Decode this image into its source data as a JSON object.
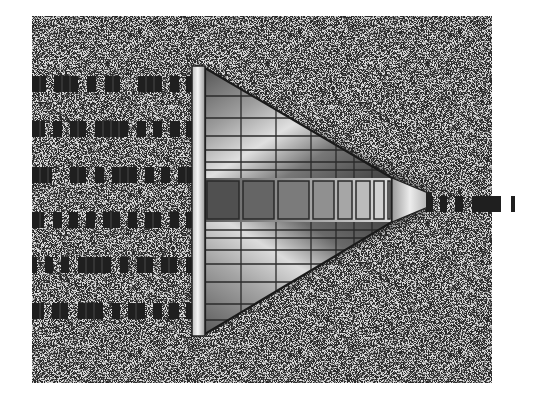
{
  "figure": {
    "background_color": "#ffffff",
    "noise_field": {
      "x": 32,
      "y": 16,
      "width": 460,
      "height": 367,
      "base": "#d8d8d8"
    },
    "prism": {
      "left_bar": {
        "x": 192,
        "y": 66,
        "width": 13,
        "height": 270
      },
      "apex": {
        "x": 392,
        "y": 200
      },
      "nozzle": {
        "x1": 392,
        "y1": 178,
        "x2": 428,
        "y2": 193,
        "y3": 207,
        "y4": 222
      },
      "center_band": {
        "y": 178,
        "height": 44
      },
      "center_cells_x": [
        205,
        241,
        276,
        311,
        336,
        354,
        372,
        386,
        392
      ],
      "colors": {
        "dark": "#3a3a3a",
        "mid": "#8a8a8a",
        "light": "#e6e6e6",
        "outline": "#202020"
      }
    },
    "input_streams": [
      {
        "y": 76,
        "dashes": [
          [
            32,
            46
          ],
          [
            54,
            78
          ],
          [
            87,
            96
          ],
          [
            105,
            120
          ],
          [
            138,
            162
          ],
          [
            170,
            179
          ],
          [
            186,
            192
          ]
        ]
      },
      {
        "y": 121,
        "dashes": [
          [
            32,
            45
          ],
          [
            53,
            62
          ],
          [
            70,
            86
          ],
          [
            95,
            128
          ],
          [
            137,
            146
          ],
          [
            153,
            162
          ],
          [
            170,
            180
          ],
          [
            186,
            192
          ]
        ]
      },
      {
        "y": 167,
        "dashes": [
          [
            32,
            52
          ],
          [
            70,
            86
          ],
          [
            95,
            104
          ],
          [
            112,
            137
          ],
          [
            145,
            154
          ],
          [
            161,
            170
          ],
          [
            178,
            192
          ]
        ]
      },
      {
        "y": 212,
        "dashes": [
          [
            32,
            44
          ],
          [
            53,
            62
          ],
          [
            69,
            78
          ],
          [
            86,
            95
          ],
          [
            103,
            120
          ],
          [
            128,
            137
          ],
          [
            145,
            161
          ],
          [
            170,
            179
          ],
          [
            186,
            192
          ]
        ]
      },
      {
        "y": 257,
        "dashes": [
          [
            32,
            37
          ],
          [
            45,
            53
          ],
          [
            61,
            69
          ],
          [
            78,
            111
          ],
          [
            120,
            128
          ],
          [
            137,
            153
          ],
          [
            161,
            177
          ],
          [
            186,
            192
          ]
        ]
      },
      {
        "y": 303,
        "dashes": [
          [
            32,
            44
          ],
          [
            52,
            68
          ],
          [
            78,
            103
          ],
          [
            112,
            120
          ],
          [
            128,
            145
          ],
          [
            153,
            162
          ],
          [
            169,
            179
          ],
          [
            186,
            192
          ]
        ]
      }
    ],
    "output_stream": {
      "y": 196,
      "height": 16,
      "dashes": [
        [
          426,
          433
        ],
        [
          440,
          447
        ],
        [
          455,
          463
        ],
        [
          472,
          501
        ],
        [
          511,
          515
        ]
      ]
    },
    "dash_color": "#1f1f1f",
    "dash_height": 16
  }
}
